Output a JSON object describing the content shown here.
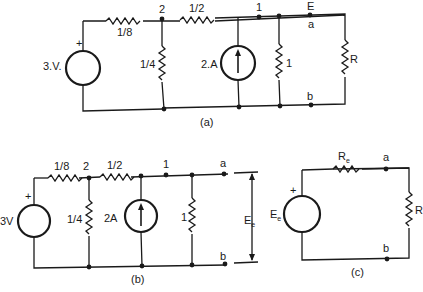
{
  "figure_a": {
    "caption": "(a)",
    "voltage_source": "3.V.",
    "plus": "+",
    "r_series_1": "1/8",
    "r_shunt_2": "1/4",
    "r_series_2": "1/2",
    "current_source": "2.A",
    "r_shunt_1": "1",
    "load": "R",
    "node_2": "2",
    "node_1": "1",
    "node_E": "E",
    "node_a": "a",
    "node_b": "b"
  },
  "figure_b": {
    "caption": "(b)",
    "voltage_source": "3V",
    "plus": "+",
    "r_series_1": "1/8",
    "r_shunt_2": "1/4",
    "r_series_2": "1/2",
    "current_source": "2A",
    "r_shunt_1": "1",
    "node_2": "2",
    "node_1": "1",
    "node_a": "a",
    "node_b": "b",
    "equiv_voltage": "E",
    "equiv_voltage_sub": "e"
  },
  "figure_c": {
    "caption": "(c)",
    "source_label": "E",
    "source_sub": "e",
    "plus": "+",
    "series_res": "R",
    "series_res_sub": "e",
    "load": "R",
    "node_a": "a",
    "node_b": "b"
  }
}
